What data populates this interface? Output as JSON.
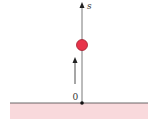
{
  "diagram": {
    "axis": {
      "label": "s",
      "origin_label": "0"
    },
    "colors": {
      "ground_fill": "#f9d9dc",
      "ground_line": "#444444",
      "axis": "#555555",
      "ball_fill": "#e8344a",
      "ball_stroke": "#a0202e",
      "arrow": "#222222"
    },
    "elements": {
      "ball": "ball",
      "velocity_arrow": "upward velocity arrow",
      "ground": "ground"
    }
  }
}
